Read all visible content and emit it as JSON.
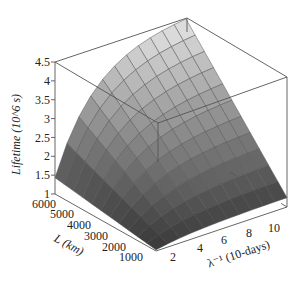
{
  "chart_data": {
    "type": "surface3d",
    "title": "",
    "zlabel": "Lifetime (10^6 s)",
    "ylabel": "L (km)",
    "xlabel": "λ⁻¹ (10-days)",
    "z_ticks": [
      "1",
      "1.5",
      "2",
      "2.5",
      "3",
      "3.5",
      "4",
      "4.5"
    ],
    "zlim": [
      1,
      4.5
    ],
    "y_ticks": [
      "6000",
      "5000",
      "4000",
      "3000",
      "2000",
      "1000"
    ],
    "ylim": [
      1000,
      6000
    ],
    "x_ticks": [
      "2",
      "4",
      "6",
      "8",
      "10"
    ],
    "xlim": [
      1,
      12
    ],
    "grid": false,
    "box": true,
    "colormap": "grayscale (dark low, light high)",
    "surface_description": "Lifetime increases with L and saturates with λ⁻¹; ~1 at L=1000 rising to ~4.5 at L=6000, large λ⁻¹",
    "sample_points": [
      {
        "lambda_inv": 2,
        "L": 1000,
        "lifetime": 1.0
      },
      {
        "lambda_inv": 12,
        "L": 1000,
        "lifetime": 2.7
      },
      {
        "lambda_inv": 2,
        "L": 6000,
        "lifetime": 1.1
      },
      {
        "lambda_inv": 12,
        "L": 6000,
        "lifetime": 4.5
      }
    ]
  }
}
